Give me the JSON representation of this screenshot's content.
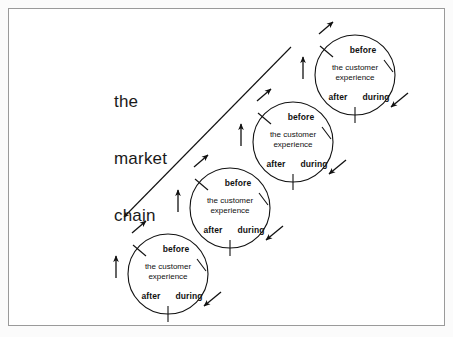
{
  "diagram": {
    "title": "the\nmarket\nchain",
    "title_lines": [
      "the",
      "market",
      "chain"
    ],
    "frame_color": "#9a9a9a",
    "background_color": "#ffffff",
    "stroke_color": "#111111",
    "text_color": "#111111",
    "node_count": 4,
    "nodes": [
      {
        "id": "cycle-1",
        "cx": 168,
        "cy": 274,
        "r": 40,
        "before": "before",
        "experience_line1": "the customer",
        "experience_line2": "experience",
        "after": "after",
        "during": "during"
      },
      {
        "id": "cycle-2",
        "cx": 230,
        "cy": 208,
        "r": 40,
        "before": "before",
        "experience_line1": "the customer",
        "experience_line2": "experience",
        "after": "after",
        "during": "during"
      },
      {
        "id": "cycle-3",
        "cx": 293,
        "cy": 142,
        "r": 40,
        "before": "before",
        "experience_line1": "the customer",
        "experience_line2": "experience",
        "after": "after",
        "during": "during"
      },
      {
        "id": "cycle-4",
        "cx": 355,
        "cy": 75,
        "r": 40,
        "before": "before",
        "experience_line1": "the customer",
        "experience_line2": "experience",
        "after": "after",
        "during": "during"
      }
    ],
    "chain_line": {
      "x1": 122,
      "y1": 219,
      "x2": 291,
      "y2": 47,
      "arrow_at": "start",
      "arrow_direction": "down-left"
    }
  }
}
